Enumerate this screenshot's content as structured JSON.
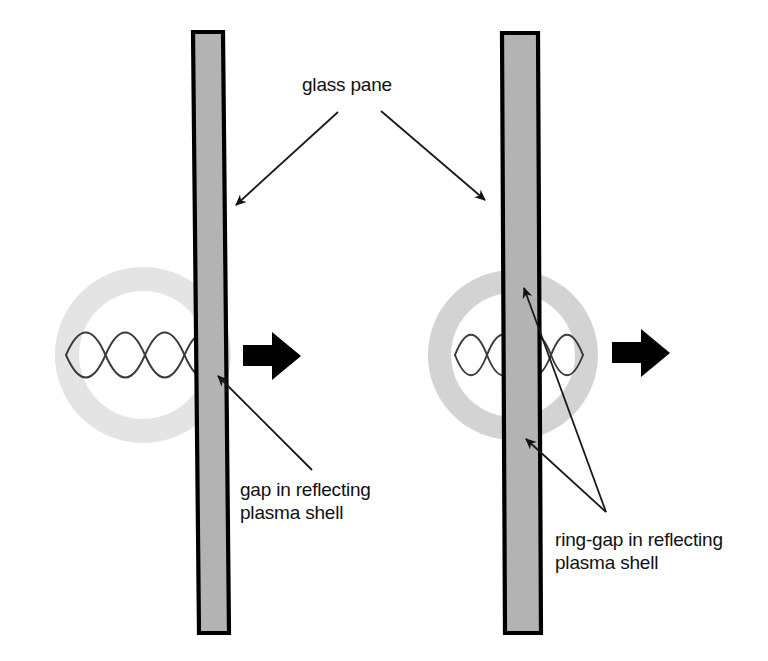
{
  "figure": {
    "background_color": "#ffffff",
    "colors": {
      "pane_fill": "#b3b3b3",
      "pane_border": "#000000",
      "shell_left": "#e4e4e4",
      "shell_right": "#d3d3d3",
      "wave_stroke": "#3a3a3a",
      "arrow_black": "#000000",
      "leader_line": "#1a1a1a",
      "text": "#111111"
    }
  },
  "labels": {
    "glass_pane": "glass pane",
    "gap_line1": "gap in reflecting",
    "gap_line2": "plasma shell",
    "ring_gap_line1": "ring-gap in reflecting",
    "ring_gap_line2": "plasma shell"
  },
  "panels": [
    {
      "id": "left-panel",
      "name": "gap-in-plasma-shell-panel",
      "shell": {
        "center_x": 143,
        "center_y": 355,
        "outer_radius": 88,
        "inner_radius": 64,
        "fill": "#e4e4e4"
      },
      "pane": {
        "top_left_x": 193,
        "top_y": 32,
        "bottom_left_x": 199,
        "bottom_y": 633,
        "width": 30,
        "fill": "#b3b3b3"
      },
      "standing_wave": {
        "left_x": 66,
        "right_x": 224,
        "center_y": 355,
        "amplitude": 30,
        "lobes": 2
      },
      "propagation_arrow": {
        "x": 243,
        "y": 355,
        "length": 58,
        "direction": "right"
      }
    },
    {
      "id": "right-panel",
      "name": "ring-gap-in-plasma-shell-panel",
      "shell": {
        "center_x": 513,
        "center_y": 355,
        "outer_radius": 85,
        "inner_radius": 62,
        "fill": "#d3d3d3"
      },
      "pane": {
        "top_left_x": 502,
        "top_y": 33,
        "bottom_left_x": 505,
        "bottom_y": 633,
        "width": 36,
        "fill": "#b3b3b3"
      },
      "standing_wave": {
        "left_x": 455,
        "right_x": 583,
        "center_y": 355,
        "amplitude": 27,
        "lobes": 2
      },
      "propagation_arrow": {
        "x": 612,
        "y": 352,
        "length": 58,
        "direction": "right"
      }
    }
  ],
  "annotations": [
    {
      "name": "glass-pane-annotation",
      "text_x": 302,
      "text_y": 91,
      "leaders": [
        {
          "from_x": 338,
          "from_y": 112,
          "to_x": 234,
          "to_y": 207
        },
        {
          "from_x": 381,
          "from_y": 111,
          "to_x": 487,
          "to_y": 202
        }
      ]
    },
    {
      "name": "gap-annotation",
      "text_x": 240,
      "text_y": 496,
      "leaders": [
        {
          "from_x": 312,
          "from_y": 470,
          "to_x": 216,
          "to_y": 374
        }
      ]
    },
    {
      "name": "ring-gap-annotation",
      "text_x": 499,
      "text_y": 546,
      "leaders": [
        {
          "from_x": 606,
          "from_y": 512,
          "to_x": 522,
          "to_y": 286
        },
        {
          "from_x": 606,
          "from_y": 512,
          "to_x": 524,
          "to_y": 437
        }
      ]
    }
  ]
}
